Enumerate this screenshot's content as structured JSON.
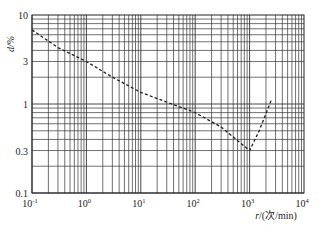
{
  "chart_data": {
    "type": "line",
    "title": "",
    "xlabel": "r/(次/min)",
    "ylabel": "d/%",
    "xscale": "log",
    "yscale": "log",
    "xlim": [
      0.1,
      10000
    ],
    "ylim": [
      0.1,
      10
    ],
    "grid": true,
    "x_ticks": [
      "10^-1",
      "10^0",
      "10^1",
      "10^2",
      "10^3",
      "10^4"
    ],
    "y_ticks": [
      "0.1",
      "0.3",
      "1",
      "3",
      "10"
    ],
    "series": [
      {
        "name": "d vs r",
        "style": "dashed",
        "x": [
          0.1,
          0.3,
          1,
          3,
          10,
          30,
          100,
          300,
          1000,
          1500,
          2500
        ],
        "y": [
          6.8,
          4.3,
          3.0,
          2.0,
          1.35,
          1.05,
          0.8,
          0.55,
          0.3,
          0.5,
          1.1
        ]
      }
    ]
  },
  "axes": {
    "x_label_italic": "r",
    "x_label_rest": "/(次/min)",
    "y_label": "d/%",
    "x_tick_labels": [
      {
        "base": "10",
        "exp": "-1"
      },
      {
        "base": "10",
        "exp": "0"
      },
      {
        "base": "10",
        "exp": "1"
      },
      {
        "base": "10",
        "exp": "2"
      },
      {
        "base": "10",
        "exp": "3"
      },
      {
        "base": "10",
        "exp": "4"
      }
    ],
    "y_tick_labels": [
      "10",
      "3",
      "1",
      "0.3",
      "0.1"
    ]
  }
}
